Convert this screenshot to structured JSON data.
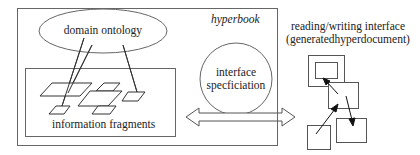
{
  "diagram": {
    "hyperbook": {
      "title": "hyperbook",
      "domain_ontology": "domain ontology",
      "information_fragments": "information fragments",
      "interface_specification": {
        "line1": "interface",
        "line2": "specficiation"
      }
    },
    "reading_interface": {
      "line1": "reading/writing interface",
      "line2": "(generatedhyperdocument)"
    },
    "connections": [
      {
        "from": "domain ontology",
        "to": "information fragments",
        "type": "lines"
      },
      {
        "from": "hyperbook",
        "to": "reading/writing interface",
        "type": "double-arrow"
      }
    ],
    "colors": {
      "stroke": "#555555",
      "text": "#222222",
      "background": "#ffffff"
    }
  }
}
